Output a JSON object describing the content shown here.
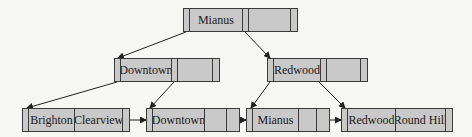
{
  "diagram": {
    "type": "B+ tree",
    "root": {
      "keys": [
        "Mianus",
        ""
      ]
    },
    "internal": [
      {
        "keys": [
          "Downtown",
          ""
        ]
      },
      {
        "keys": [
          "Redwood",
          ""
        ]
      }
    ],
    "leaves": [
      {
        "keys": [
          "Brighton",
          "Clearview"
        ]
      },
      {
        "keys": [
          "Downtown",
          ""
        ]
      },
      {
        "keys": [
          "Mianus",
          ""
        ]
      },
      {
        "keys": [
          "Redwood",
          "Round Hill"
        ]
      }
    ],
    "colors": {
      "node_fill": "#c9c9c9",
      "border": "#3a3a3a",
      "background": "#f6f6f4"
    }
  }
}
